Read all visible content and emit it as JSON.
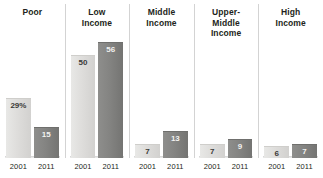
{
  "chart_data": {
    "type": "bar",
    "title": "",
    "xlabel": "",
    "ylabel": "",
    "ylim": [
      0,
      60
    ],
    "grid": false,
    "legend": "none",
    "categories": [
      "Poor",
      "Low Income",
      "Middle Income",
      "Upper-Middle Income",
      "High Income"
    ],
    "x": [
      "2001",
      "2011"
    ],
    "series": [
      {
        "name": "2001",
        "color": "#ddddda",
        "values": [
          29,
          50,
          7,
          7,
          6
        ]
      },
      {
        "name": "2011",
        "color": "#82827f",
        "values": [
          15,
          56,
          13,
          9,
          7
        ]
      }
    ],
    "groups": [
      {
        "header_lines": [
          "Poor"
        ],
        "bars": [
          {
            "year": "2001",
            "value": 29,
            "label": "29%"
          },
          {
            "year": "2011",
            "value": 15,
            "label": "15"
          }
        ]
      },
      {
        "header_lines": [
          "Low",
          "Income"
        ],
        "bars": [
          {
            "year": "2001",
            "value": 50,
            "label": "50"
          },
          {
            "year": "2011",
            "value": 56,
            "label": "56"
          }
        ]
      },
      {
        "header_lines": [
          "Middle",
          "Income"
        ],
        "bars": [
          {
            "year": "2001",
            "value": 7,
            "label": "7"
          },
          {
            "year": "2011",
            "value": 13,
            "label": "13"
          }
        ]
      },
      {
        "header_lines": [
          "Upper-",
          "Middle",
          "Income"
        ],
        "bars": [
          {
            "year": "2001",
            "value": 7,
            "label": "7"
          },
          {
            "year": "2011",
            "value": 9,
            "label": "9"
          }
        ]
      },
      {
        "header_lines": [
          "High",
          "Income"
        ],
        "bars": [
          {
            "year": "2001",
            "value": 6,
            "label": "6"
          },
          {
            "year": "2011",
            "value": 7,
            "label": "7"
          }
        ]
      }
    ]
  }
}
